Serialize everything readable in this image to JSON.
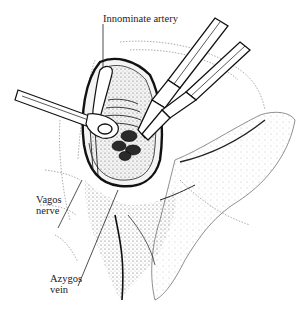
{
  "figure": {
    "labels": {
      "innominate_artery": "Innominate artery",
      "vagus_line1": "Vagos",
      "vagus_line2": "nerve",
      "azygos_line1": "Azygos",
      "azygos_line2": "vein"
    },
    "colors": {
      "ink": "#1a1a1a",
      "stipple": "#555555",
      "background": "#ffffff"
    }
  }
}
